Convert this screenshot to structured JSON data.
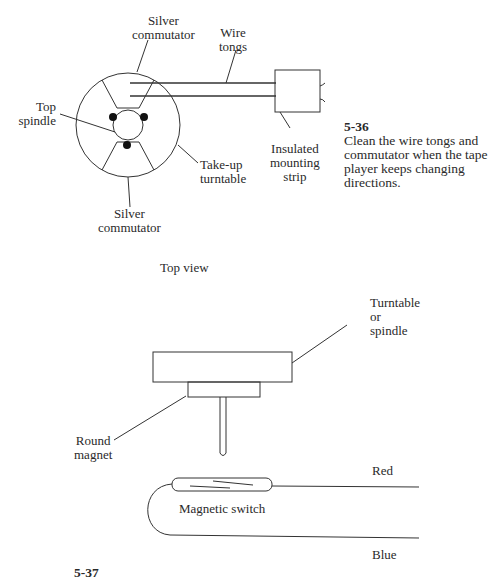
{
  "figure_top": {
    "labels": {
      "silver_commutator_top": [
        "Silver",
        "commutator"
      ],
      "wire_tongs": [
        "Wire",
        "tongs"
      ],
      "top_spindle": [
        "Top",
        "spindle"
      ],
      "take_up_turntable": [
        "Take-up",
        "turntable"
      ],
      "silver_commutator_bottom": [
        "Silver",
        "commutator"
      ],
      "insulated_mounting_strip": [
        "Insulated",
        "mounting",
        "strip"
      ]
    },
    "caption": {
      "number": "5-36",
      "text": "Clean the wire tongs and commutator when the tape player keeps changing directions."
    },
    "view_label": "Top view"
  },
  "figure_bottom": {
    "labels": {
      "turntable_or_spindle": [
        "Turntable",
        "or",
        "spindle"
      ],
      "round_magnet": [
        "Round",
        "magnet"
      ],
      "magnetic_switch": "Magnetic switch",
      "red_wire": "Red",
      "blue_wire": "Blue"
    },
    "caption_partial": "5-37"
  }
}
